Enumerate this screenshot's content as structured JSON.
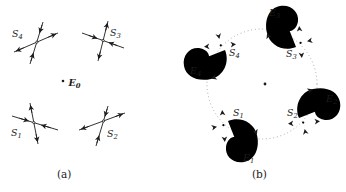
{
  "figure_type": "phase-portrait diagram, two panels",
  "colors": {
    "ink": "#1c1c1c",
    "dotted_circle": "#9a9a9a",
    "background": "#ffffff"
  },
  "panel_a": {
    "caption": "(a)",
    "labels": {
      "s4": {
        "base": "S",
        "sub": "4"
      },
      "s3": {
        "base": "S",
        "sub": "3"
      },
      "s1": {
        "base": "S",
        "sub": "1"
      },
      "s2": {
        "base": "S",
        "sub": "2"
      },
      "e0": {
        "base": "E",
        "sub": "0"
      }
    }
  },
  "panel_b": {
    "caption": "(b)",
    "labels": {
      "s4": {
        "base": "S",
        "sub": "4"
      },
      "s3": {
        "base": "S",
        "sub": "3"
      },
      "s1": {
        "base": "S",
        "sub": "1"
      },
      "s2": {
        "base": "S",
        "sub": "2"
      },
      "e4": {
        "base": "E",
        "sub": "4"
      },
      "e3": {
        "base": "E",
        "sub": "3"
      },
      "e1": {
        "base": "E",
        "sub": "1"
      },
      "e2": {
        "base": "E",
        "sub": "2"
      }
    }
  }
}
